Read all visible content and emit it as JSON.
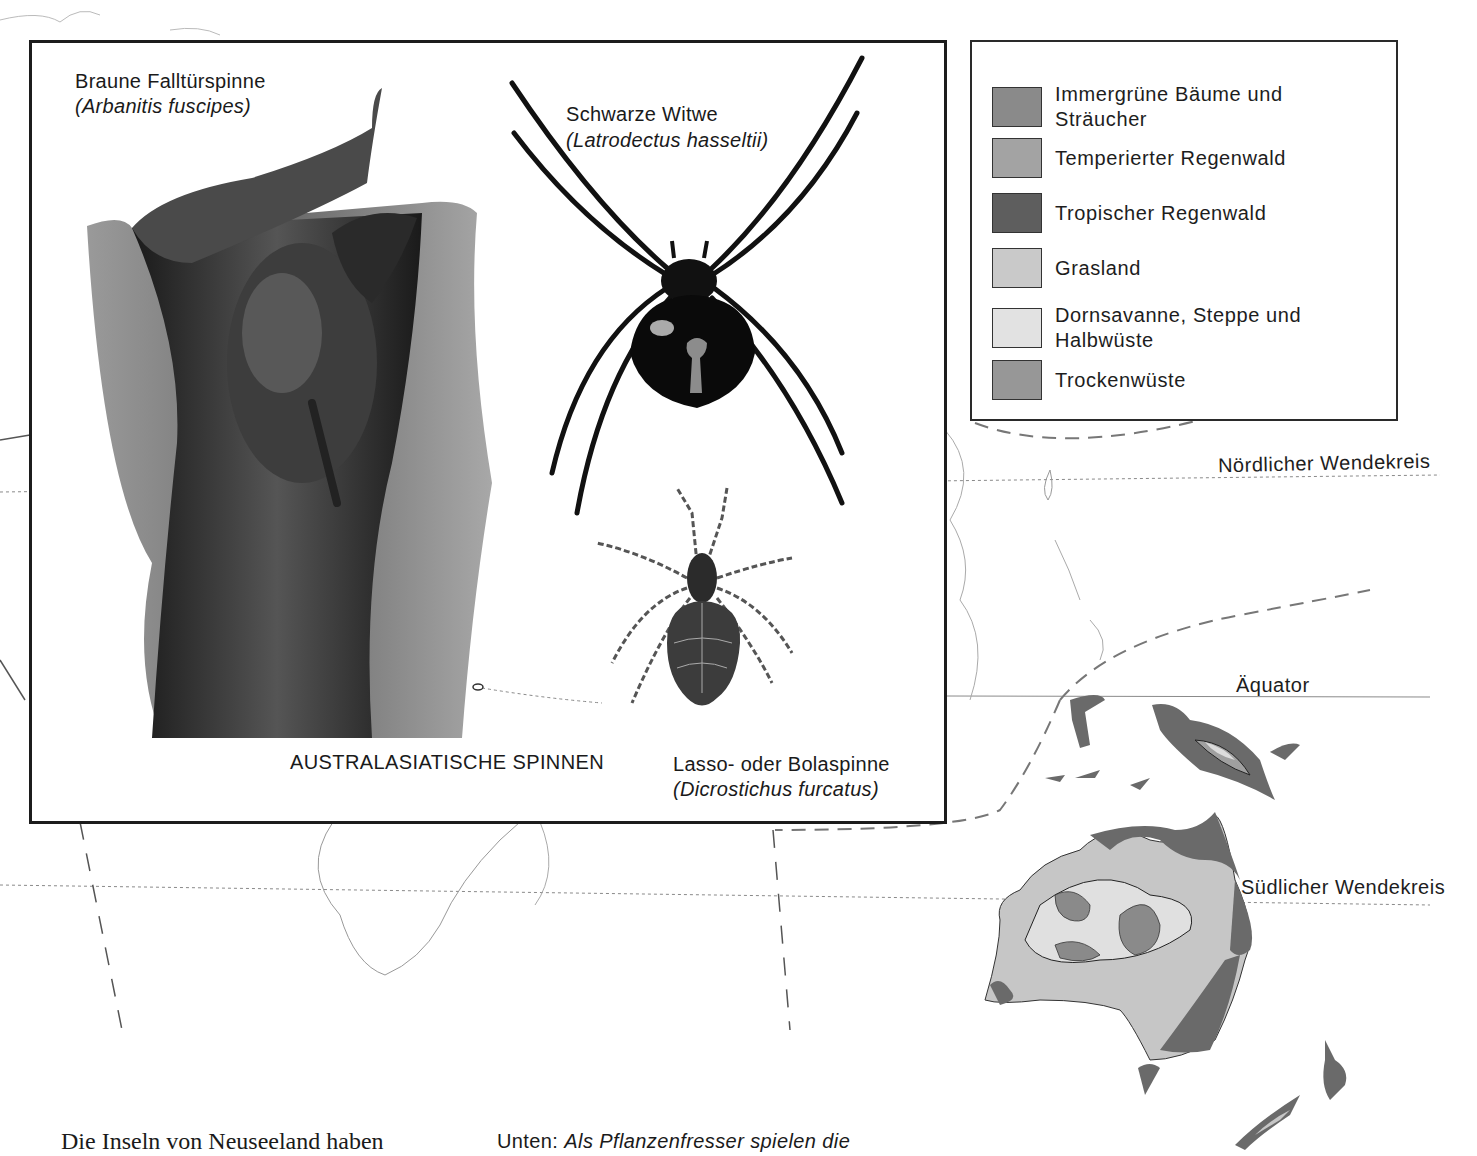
{
  "inset": {
    "title": "AUSTRALASIATISCHE SPINNEN",
    "species": [
      {
        "common_name": "Braune Falltürspinne",
        "latin_name": "(Arbanitis fuscipes)"
      },
      {
        "common_name": "Schwarze Witwe",
        "latin_name": "(Latrodectus hasseltii)"
      },
      {
        "common_name": "Lasso- oder Bolaspinne",
        "latin_name": "(Dicrostichus furcatus)"
      }
    ]
  },
  "legend": {
    "items": [
      {
        "label_line1": "Immergrüne Bäume und",
        "label_line2": "Sträucher",
        "color": "#8a8a8a"
      },
      {
        "label_line1": "Temperierter Regenwald",
        "label_line2": "",
        "color": "#a3a3a3"
      },
      {
        "label_line1": "Tropischer Regenwald",
        "label_line2": "",
        "color": "#5e5e5e"
      },
      {
        "label_line1": "Grasland",
        "label_line2": "",
        "color": "#c9c9c9"
      },
      {
        "label_line1": "Dornsavanne, Steppe und",
        "label_line2": "Halbwüste",
        "color": "#e2e2e2"
      },
      {
        "label_line1": "Trockenwüste",
        "label_line2": "",
        "color": "#979797"
      }
    ]
  },
  "map": {
    "lines": {
      "north_tropic": "Nördlicher Wendekreis",
      "equator": "Äquator",
      "south_tropic": "Südlicher Wendekreis"
    }
  },
  "page_text": {
    "body_start": "Die Inseln von Neuseeland haben",
    "caption_prefix": "Unten:",
    "caption_italic": "Als Pflanzenfresser spielen die"
  }
}
